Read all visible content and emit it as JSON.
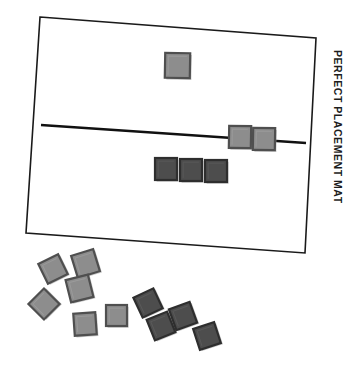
{
  "image": {
    "title": "Perfect Placement Mat with square tiles",
    "width": 353,
    "height": 365,
    "background_color": "#ffffff"
  },
  "mat": {
    "label": "PERFECT PLACEMENT MAT",
    "label_rotation_deg": 90,
    "label_position": {
      "x": 344,
      "y": 50
    },
    "outline_color": "#1a1a1a",
    "outline_width": 1.6,
    "fill_color": "#ffffff",
    "corners": [
      {
        "x": 40,
        "y": 17
      },
      {
        "x": 316,
        "y": 38
      },
      {
        "x": 305,
        "y": 253
      },
      {
        "x": 26,
        "y": 233
      }
    ]
  },
  "guide_line": {
    "name": "placement-guide-line",
    "color": "#111111",
    "width": 2.6,
    "start": {
      "x": 41,
      "y": 125
    },
    "end": {
      "x": 306,
      "y": 143
    }
  },
  "colors": {
    "tile_light_fill": "#8d8d8d",
    "tile_light_edge": "#4f4f4f",
    "tile_dark_fill": "#4d4d4d",
    "tile_dark_edge": "#2e2e2e",
    "tile_shadow": "#9a9a9a",
    "outline": "#1a1a1a",
    "line": "#111111"
  },
  "placed_tiles": [
    {
      "name": "placed-tile-top",
      "x": 165,
      "y": 53,
      "size": 25,
      "rotation": 1,
      "tone": "light"
    },
    {
      "name": "placed-tile-on-line-1",
      "x": 229,
      "y": 126,
      "size": 22,
      "rotation": 1,
      "tone": "light"
    },
    {
      "name": "placed-tile-on-line-2",
      "x": 253,
      "y": 128,
      "size": 22,
      "rotation": 1,
      "tone": "light"
    },
    {
      "name": "placed-tile-row-1",
      "x": 155,
      "y": 158,
      "size": 22,
      "rotation": 0,
      "tone": "dark"
    },
    {
      "name": "placed-tile-row-2",
      "x": 180,
      "y": 159,
      "size": 22,
      "rotation": 0,
      "tone": "dark"
    },
    {
      "name": "placed-tile-row-3",
      "x": 205,
      "y": 160,
      "size": 22,
      "rotation": 0,
      "tone": "dark"
    }
  ],
  "loose_tiles": [
    {
      "name": "loose-tile-1",
      "x": 42,
      "y": 258,
      "size": 22,
      "rotation": -26,
      "tone": "light"
    },
    {
      "name": "loose-tile-2",
      "x": 74,
      "y": 252,
      "size": 23,
      "rotation": -17,
      "tone": "light"
    },
    {
      "name": "loose-tile-3",
      "x": 68,
      "y": 277,
      "size": 23,
      "rotation": -14,
      "tone": "light"
    },
    {
      "name": "loose-tile-4",
      "x": 33,
      "y": 293,
      "size": 22,
      "rotation": -45,
      "tone": "light"
    },
    {
      "name": "loose-tile-5",
      "x": 74,
      "y": 313,
      "size": 22,
      "rotation": -4,
      "tone": "light"
    },
    {
      "name": "loose-tile-6",
      "x": 106,
      "y": 305,
      "size": 21,
      "rotation": 0,
      "tone": "light"
    },
    {
      "name": "loose-tile-7",
      "x": 137,
      "y": 292,
      "size": 22,
      "rotation": -25,
      "tone": "dark"
    },
    {
      "name": "loose-tile-8",
      "x": 150,
      "y": 315,
      "size": 22,
      "rotation": -22,
      "tone": "dark"
    },
    {
      "name": "loose-tile-9",
      "x": 172,
      "y": 305,
      "size": 22,
      "rotation": -20,
      "tone": "dark"
    },
    {
      "name": "loose-tile-10",
      "x": 196,
      "y": 325,
      "size": 22,
      "rotation": -18,
      "tone": "dark"
    }
  ]
}
